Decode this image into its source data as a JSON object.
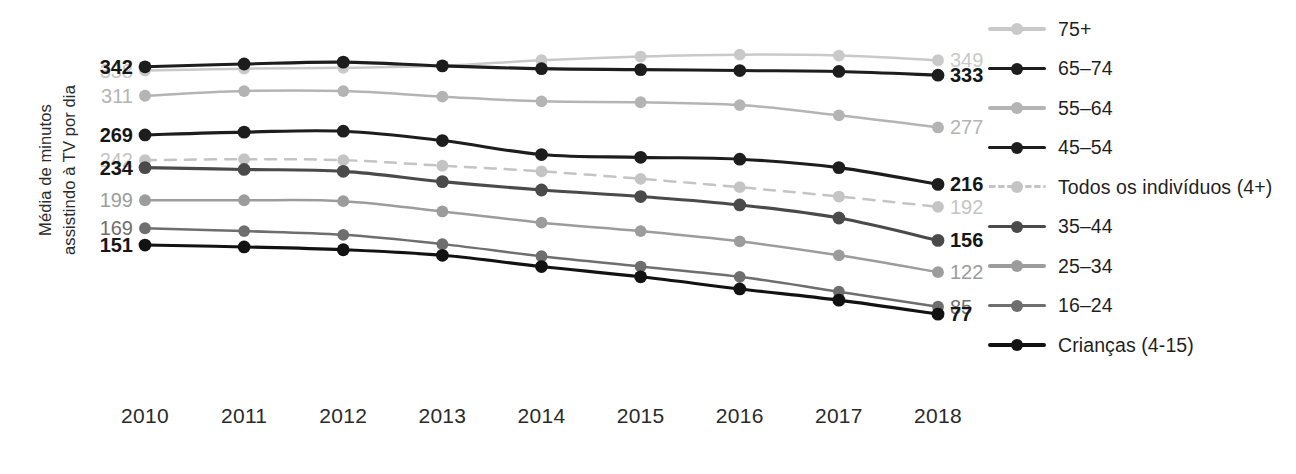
{
  "chart_data": {
    "type": "line",
    "title": "",
    "xlabel": "",
    "ylabel": "Média de minutos assistindo à TV por dia",
    "ylabel_lines": [
      "Média de minutos",
      "assistindo à TV por dia"
    ],
    "categories": [
      "2010",
      "2011",
      "2012",
      "2013",
      "2014",
      "2015",
      "2016",
      "2017",
      "2018"
    ],
    "x": [
      2010,
      2011,
      2012,
      2013,
      2014,
      2015,
      2016,
      2017,
      2018
    ],
    "ylim": [
      60,
      360
    ],
    "grid": false,
    "legend_position": "right",
    "series": [
      {
        "name": "75+",
        "color": "#c9c9c9",
        "dash": false,
        "emphasis": false,
        "values": [
          338,
          340,
          341,
          343,
          349,
          353,
          355,
          354,
          349
        ],
        "start_label": "338",
        "end_label": "349"
      },
      {
        "name": "65–74",
        "color": "#1d1d1d",
        "dash": false,
        "emphasis": true,
        "values": [
          342,
          345,
          347,
          343,
          340,
          339,
          338,
          337,
          333
        ],
        "start_label": "342",
        "end_label": "333"
      },
      {
        "name": "55–64",
        "color": "#b4b4b4",
        "dash": false,
        "emphasis": false,
        "values": [
          311,
          316,
          316,
          310,
          305,
          304,
          301,
          290,
          277
        ],
        "start_label": "311",
        "end_label": "277"
      },
      {
        "name": "45–54",
        "color": "#1d1d1d",
        "dash": false,
        "emphasis": true,
        "values": [
          269,
          272,
          273,
          263,
          248,
          245,
          243,
          234,
          216
        ],
        "start_label": "269",
        "end_label": "216"
      },
      {
        "name": "Todos os indivíduos (4+)",
        "color": "#c4c4c4",
        "dash": true,
        "emphasis": false,
        "values": [
          242,
          243,
          242,
          236,
          230,
          222,
          213,
          203,
          192
        ],
        "start_label": "242",
        "end_label": "192"
      },
      {
        "name": "35–44",
        "color": "#4a4a4a",
        "dash": false,
        "emphasis": true,
        "values": [
          234,
          232,
          230,
          219,
          210,
          203,
          194,
          180,
          156
        ],
        "start_label": "234",
        "end_label": "156"
      },
      {
        "name": "25–34",
        "color": "#9c9c9c",
        "dash": false,
        "emphasis": false,
        "values": [
          199,
          199,
          198,
          187,
          175,
          166,
          155,
          140,
          122
        ],
        "start_label": "199",
        "end_label": "122"
      },
      {
        "name": "16–24",
        "color": "#6e6e6e",
        "dash": false,
        "emphasis": false,
        "values": [
          169,
          166,
          162,
          152,
          139,
          128,
          117,
          101,
          85
        ],
        "start_label": "169",
        "end_label": "85"
      },
      {
        "name": "Crianças (4-15)",
        "color": "#121212",
        "dash": false,
        "emphasis": true,
        "values": [
          151,
          149,
          146,
          140,
          128,
          117,
          104,
          92,
          77
        ],
        "start_label": "151",
        "end_label": "77"
      }
    ]
  },
  "axis": {
    "y_title_line1": "Média de minutos",
    "y_title_line2": "assistindo à TV por dia"
  },
  "legend": {
    "items": [
      {
        "label": "75+",
        "color": "#c9c9c9",
        "dash": false
      },
      {
        "label": "65–74",
        "color": "#1d1d1d",
        "dash": false
      },
      {
        "label": "55–64",
        "color": "#b4b4b4",
        "dash": false
      },
      {
        "label": "45–54",
        "color": "#1d1d1d",
        "dash": false
      },
      {
        "label": "Todos os indivíduos (4+)",
        "color": "#c4c4c4",
        "dash": true
      },
      {
        "label": "35–44",
        "color": "#4a4a4a",
        "dash": false
      },
      {
        "label": "25–34",
        "color": "#9c9c9c",
        "dash": false
      },
      {
        "label": "16–24",
        "color": "#6e6e6e",
        "dash": false
      },
      {
        "label": "Crianças (4-15)",
        "color": "#121212",
        "dash": false
      }
    ]
  }
}
